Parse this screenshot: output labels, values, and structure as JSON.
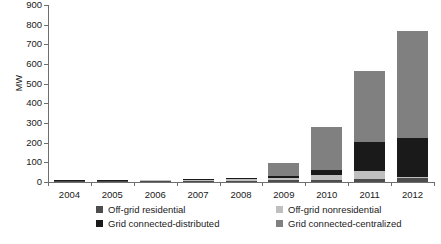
{
  "chart_data": {
    "type": "bar",
    "title": "",
    "xlabel": "",
    "ylabel": "MW",
    "ylim": [
      0,
      900
    ],
    "yticks": [
      0,
      100,
      200,
      300,
      400,
      500,
      600,
      700,
      800,
      900
    ],
    "grid": false,
    "stacked": true,
    "legend_position": "bottom",
    "categories": [
      "2004",
      "2005",
      "2006",
      "2007",
      "2008",
      "2009",
      "2010",
      "2011",
      "2012"
    ],
    "series": [
      {
        "name": "Off-grid residential",
        "color": "#4d4d4d",
        "values": [
          4,
          4,
          5,
          6,
          7,
          9,
          12,
          15,
          18
        ]
      },
      {
        "name": "Off-grid nonresidential",
        "color": "#bfbfbf",
        "values": [
          2,
          3,
          4,
          5,
          6,
          10,
          22,
          40,
          10
        ]
      },
      {
        "name": "Grid connected-distributed",
        "color": "#1a1a1a",
        "values": [
          2,
          2,
          3,
          4,
          6,
          14,
          28,
          148,
          195
        ]
      },
      {
        "name": "Grid connected-centralized",
        "color": "#808080",
        "values": [
          0,
          0,
          0,
          0,
          2,
          62,
          218,
          362,
          545
        ]
      }
    ],
    "totals": [
      8,
      9,
      12,
      15,
      21,
      95,
      280,
      565,
      768
    ]
  },
  "legend": {
    "items": [
      {
        "label": "Off-grid residential",
        "color": "#4d4d4d"
      },
      {
        "label": "Off-grid nonresidential",
        "color": "#bfbfbf"
      },
      {
        "label": "Grid connected-distributed",
        "color": "#1a1a1a"
      },
      {
        "label": "Grid connected-centralized",
        "color": "#808080"
      }
    ]
  }
}
